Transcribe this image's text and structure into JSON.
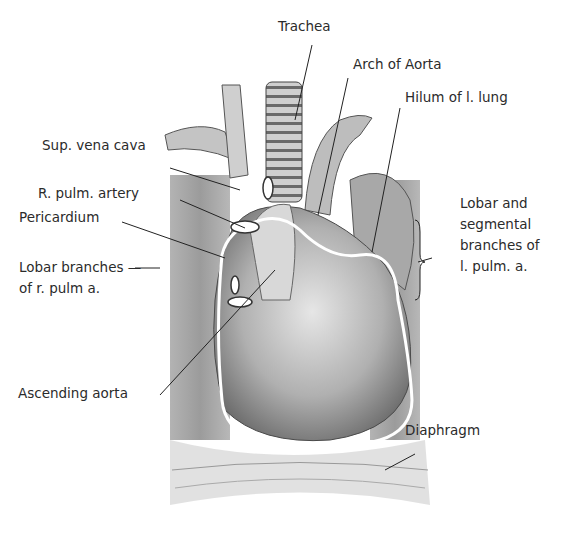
{
  "figure": {
    "labels": {
      "trachea": "Trachea",
      "arch_of_aorta": "Arch of Aorta",
      "hilum_l_lung": "Hilum of l. lung",
      "sup_vena_cava": "Sup. vena cava",
      "r_pulm_artery": "R. pulm. artery",
      "pericardium": "Pericardium",
      "lobar_branches_r": "Lobar branches —\nof r. pulm a.",
      "lobar_segmental_l": "Lobar and\nsegmental\nbranches of\nl. pulm. a.",
      "ascending_aorta": "Ascending aorta",
      "diaphragm": "Diaphragm"
    },
    "colors": {
      "background": "#ffffff",
      "ink": "#2b2b2b",
      "lung_shade": "#8a8a8a",
      "heart_shade": "#b5b5b5",
      "pericardium_outline": "#ffffff"
    }
  }
}
